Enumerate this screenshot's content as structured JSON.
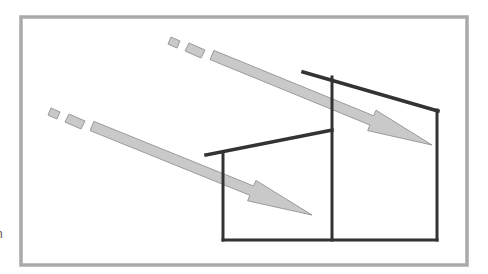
{
  "diagram": {
    "title": "",
    "frame": {
      "x": 21,
      "y": 17,
      "width": 446,
      "height": 248,
      "color": "#a9a9a9"
    },
    "colors": {
      "structure": "#333333",
      "arrow_fill": "#c9c9c9",
      "arrow_stroke": "#9a9a9a"
    },
    "edge_glyph": "n",
    "building": {
      "upper_roof": [
        [
          303,
          72
        ],
        [
          438,
          111
        ]
      ],
      "lower_roof": [
        [
          206,
          155
        ],
        [
          332,
          130
        ]
      ],
      "left_wall": [
        [
          223,
          153
        ],
        [
          223,
          240
        ]
      ],
      "center_wall": [
        [
          332,
          77
        ],
        [
          332,
          240
        ]
      ],
      "right_wall": [
        [
          437,
          110
        ],
        [
          437,
          240
        ]
      ],
      "floor": [
        [
          223,
          240
        ],
        [
          437,
          240
        ]
      ]
    },
    "arrows": [
      {
        "name": "upper-sun-ray",
        "dashes": [
          [
            [
              171,
              37
            ],
            [
              180,
              41
            ],
            [
              177,
              48
            ],
            [
              168,
              44
            ]
          ],
          [
            [
              189,
              43
            ],
            [
              205,
              50
            ],
            [
              201,
              58
            ],
            [
              185,
              51
            ]
          ]
        ],
        "shaft_start": [
          212,
          55
        ],
        "tip": [
          432,
          145
        ]
      },
      {
        "name": "lower-sun-ray",
        "dashes": [
          [
            [
              51,
              108
            ],
            [
              60,
              112
            ],
            [
              57,
              119
            ],
            [
              48,
              115
            ]
          ],
          [
            [
              69,
              114
            ],
            [
              85,
              121
            ],
            [
              81,
              129
            ],
            [
              65,
              122
            ]
          ]
        ],
        "shaft_start": [
          92,
          126
        ],
        "tip": [
          312,
          215
        ]
      }
    ]
  }
}
